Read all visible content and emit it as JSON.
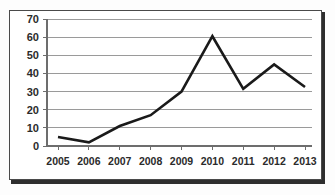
{
  "chart_data": {
    "type": "line",
    "title": "",
    "subtitle": "",
    "xlabel": "",
    "ylabel": "",
    "categories": [
      "2005",
      "2006",
      "2007",
      "2008",
      "2009",
      "2010",
      "2011",
      "2012",
      "2013"
    ],
    "values": [
      5,
      2,
      11,
      17,
      30,
      60.5,
      31.5,
      45,
      32.5
    ],
    "series": [
      {
        "name": "",
        "values": [
          5,
          2,
          11,
          17,
          30,
          60.5,
          31.5,
          45,
          32.5
        ]
      }
    ],
    "ylim": [
      0,
      70
    ],
    "y_ticks": [
      0,
      10,
      20,
      30,
      40,
      50,
      60,
      70
    ],
    "y_tick_labels": [
      "0",
      "10",
      "20",
      "30",
      "40",
      "50",
      "60",
      "70"
    ],
    "x_tick_labels": [
      "2005",
      "2006",
      "2007",
      "2008",
      "2009",
      "2010",
      "2011",
      "2012",
      "2013"
    ],
    "grid": true,
    "grid_axis": "y",
    "legend": false,
    "legend_position": "none",
    "markers": false,
    "annotations": [],
    "colors": {
      "line": "#1a1a1a",
      "grid": "#9a9a9a",
      "axis": "#6d6d6d",
      "text": "#2b2b2b",
      "background": "#ffffff",
      "frame_border": "#4a4a4a",
      "frame_shadow": "#2e2e2e"
    }
  }
}
